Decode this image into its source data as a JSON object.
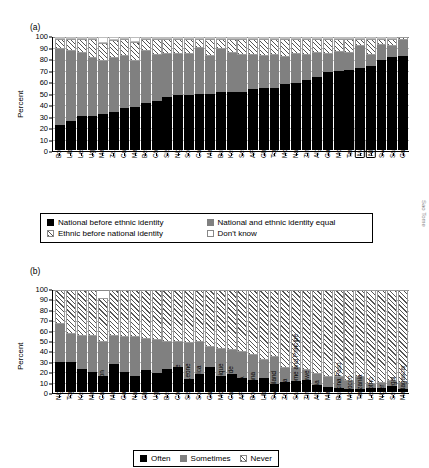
{
  "panels": {
    "a": {
      "tag": "(a)",
      "ylabel": "Percent"
    },
    "b": {
      "tag": "(b)",
      "ylabel": "Percent"
    }
  },
  "axis": {
    "ticks": [
      "100",
      "90",
      "80",
      "70",
      "60",
      "50",
      "40",
      "30",
      "20",
      "10",
      "0"
    ]
  },
  "legend_a": [
    {
      "key": "black",
      "label": "National before ethnic identity"
    },
    {
      "key": "gray",
      "label": "National and ethnic identity equal"
    },
    {
      "key": "hatch",
      "label": "Ethnic before national identity"
    },
    {
      "key": "white",
      "label": "Don't know"
    }
  ],
  "legend_b": [
    {
      "key": "black",
      "label": "Often"
    },
    {
      "key": "gray",
      "label": "Sometimes"
    },
    {
      "key": "hatch",
      "label": "Never"
    }
  ],
  "chart_data": [
    {
      "type": "bar",
      "id": "panel-a",
      "title": "(a)",
      "xlabel": "",
      "ylabel": "Percent",
      "ylim": [
        0,
        100
      ],
      "ytick_step": 10,
      "grid": true,
      "stacked": true,
      "legend_position": "below",
      "categories": [
        "Botswana",
        "Liberia",
        "Lesotho",
        "Uganda",
        "Mauritius",
        "Zambia",
        "Cape Verde",
        "Malawi",
        "Benin",
        "Côte d'Ivoire",
        "Sierra Leone",
        "Nigeria",
        "South Africa",
        "Cameroon",
        "Mali",
        "Burkina Faso",
        "Kenya",
        "Senegal",
        "AFRICA",
        "Ghana",
        "Togo",
        "Morocco",
        "Namibia",
        "Zimbabwe",
        "Algeria",
        "Gabon",
        "Mozambique",
        "Tanzania",
        "Madagascar",
        "Niger",
        "Swaziland",
        "Sao Tome and Principe",
        "Guinea"
      ],
      "highlighted_categories": [
        "Madagascar",
        "Niger"
      ],
      "series": [
        {
          "name": "National before ethnic identity",
          "color": "#000000",
          "values": [
            22,
            26,
            30,
            30,
            32,
            34,
            37,
            38,
            42,
            43,
            47,
            49,
            49,
            50,
            50,
            51,
            51,
            51,
            54,
            55,
            55,
            58,
            59,
            62,
            65,
            69,
            70,
            71,
            73,
            74,
            80,
            83,
            83
          ]
        },
        {
          "name": "National and ethnic identity equal",
          "color": "#808080",
          "values": [
            67,
            62,
            56,
            51,
            47,
            47,
            46,
            41,
            46,
            41,
            38,
            36,
            36,
            40,
            33,
            38,
            35,
            33,
            30,
            28,
            29,
            24,
            26,
            22,
            21,
            16,
            17,
            15,
            19,
            10,
            14,
            10,
            14
          ]
        },
        {
          "name": "Ethnic before national identity",
          "color": "#ffffff",
          "hatch": true,
          "values": [
            9,
            10,
            12,
            17,
            16,
            16,
            15,
            17,
            10,
            14,
            13,
            13,
            13,
            8,
            15,
            9,
            12,
            14,
            14,
            15,
            14,
            16,
            13,
            14,
            12,
            13,
            11,
            12,
            6,
            14,
            5,
            6,
            3
          ]
        },
        {
          "name": "Don't know",
          "color": "#ffffff",
          "values": [
            2,
            2,
            2,
            2,
            5,
            3,
            2,
            4,
            2,
            2,
            2,
            2,
            2,
            2,
            2,
            2,
            2,
            2,
            2,
            2,
            2,
            2,
            2,
            2,
            2,
            2,
            2,
            2,
            2,
            2,
            1,
            1,
            0
          ]
        }
      ]
    },
    {
      "type": "bar",
      "id": "panel-b",
      "title": "(b)",
      "xlabel": "",
      "ylabel": "Percent",
      "ylim": [
        0,
        100
      ],
      "ytick_step": 10,
      "grid": true,
      "stacked": true,
      "legend_position": "below",
      "categories": [
        "Nigeria",
        "Togo",
        "Kenya",
        "Mauritius",
        "Cameroon",
        "Malawi",
        "Gabon",
        "Namibia",
        "Ghana",
        "Uganda",
        "Benin",
        "Côte d'Ivoire",
        "Sierra Leone",
        "South Africa",
        "Guinea",
        "Mozambique",
        "Cape Verde",
        "AFRICA",
        "Botswana",
        "Liberia",
        "Swaziland",
        "Zambia",
        "Sao Tome and Principe",
        "Zimbabwe",
        "Algeria",
        "Mali",
        "Burkina Faso",
        "Morocco",
        "Tanzania",
        "Lesotho",
        "Niger",
        "Senegal",
        "Madagascar"
      ],
      "highlighted_categories": [],
      "series": [
        {
          "name": "Often",
          "color": "#000000",
          "values": [
            29,
            29,
            23,
            20,
            16,
            27,
            20,
            16,
            22,
            19,
            23,
            25,
            13,
            18,
            25,
            16,
            18,
            14,
            12,
            14,
            8,
            10,
            11,
            12,
            7,
            5,
            4,
            3,
            3,
            4,
            4,
            6,
            3
          ]
        },
        {
          "name": "Sometimes",
          "color": "#808080",
          "values": [
            38,
            28,
            32,
            35,
            33,
            28,
            34,
            38,
            30,
            32,
            26,
            24,
            35,
            31,
            19,
            26,
            23,
            25,
            24,
            17,
            26,
            14,
            13,
            10,
            11,
            10,
            11,
            8,
            12,
            4,
            5,
            5,
            6
          ]
        },
        {
          "name": "Never",
          "color": "#ffffff",
          "hatch": true,
          "values": [
            33,
            43,
            45,
            45,
            43,
            45,
            46,
            46,
            48,
            49,
            51,
            51,
            52,
            51,
            56,
            58,
            59,
            61,
            64,
            69,
            66,
            76,
            76,
            78,
            82,
            85,
            85,
            89,
            85,
            92,
            91,
            89,
            91
          ]
        }
      ]
    }
  ],
  "edge_artifacts": {
    "a": "Sao Tome",
    "b": "S"
  }
}
